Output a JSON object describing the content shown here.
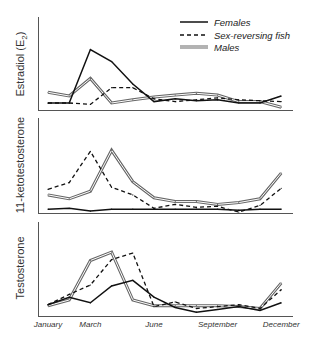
{
  "chart_data": [
    {
      "type": "line",
      "panel": "estradiol",
      "ylabel": "Estradiol (E",
      "ylabel_sub": "2",
      "ylabel_close": ")",
      "ylim": [
        0,
        100
      ],
      "x": [
        "Jan",
        "Feb",
        "Mar",
        "Apr",
        "May",
        "Jun",
        "Jul",
        "Aug",
        "Sep",
        "Oct",
        "Nov",
        "Dec"
      ],
      "series": [
        {
          "name": "Females",
          "style": "solid",
          "values": [
            7.5,
            7.5,
            65,
            52,
            28,
            9,
            12,
            10,
            11,
            7.5,
            7.5,
            15
          ]
        },
        {
          "name": "Sex-reversing fish",
          "style": "dashed",
          "values": [
            7.5,
            7.5,
            6,
            24,
            24,
            12,
            9,
            11,
            13,
            11,
            10,
            9
          ]
        },
        {
          "name": "Males",
          "style": "double",
          "values": [
            19,
            15,
            34,
            7.5,
            11,
            14,
            16,
            18,
            16,
            9,
            9,
            3
          ]
        }
      ]
    },
    {
      "type": "line",
      "panel": "ketotestosterone",
      "ylabel": "11-ketotestosterone",
      "ylim": [
        0,
        100
      ],
      "x": [
        "Jan",
        "Feb",
        "Mar",
        "Apr",
        "May",
        "Jun",
        "Jul",
        "Aug",
        "Sep",
        "Oct",
        "Nov",
        "Dec"
      ],
      "series": [
        {
          "name": "Females",
          "style": "solid",
          "values": [
            4,
            5,
            2,
            4,
            4,
            4,
            4,
            4,
            4,
            3,
            4,
            4
          ]
        },
        {
          "name": "Sex-reversing fish",
          "style": "dashed",
          "values": [
            25,
            32,
            65,
            27,
            19,
            5,
            9,
            6,
            7,
            1,
            8,
            26
          ]
        },
        {
          "name": "Males",
          "style": "double",
          "values": [
            19,
            15,
            23,
            66,
            33,
            16,
            12,
            12,
            9,
            11,
            15,
            42
          ]
        }
      ]
    },
    {
      "type": "line",
      "panel": "testosterone",
      "ylabel": "Testosterone",
      "ylim": [
        0,
        100
      ],
      "x": [
        "Jan",
        "Feb",
        "Mar",
        "Apr",
        "May",
        "Jun",
        "Jul",
        "Aug",
        "Sep",
        "Oct",
        "Nov",
        "Dec"
      ],
      "xtick_labels": [
        {
          "label": "January",
          "month_index": 0
        },
        {
          "label": "March",
          "month_index": 2
        },
        {
          "label": "June",
          "month_index": 5
        },
        {
          "label": "September",
          "month_index": 8
        },
        {
          "label": "December",
          "month_index": 11
        }
      ],
      "series": [
        {
          "name": "Females",
          "style": "solid",
          "values": [
            12,
            20,
            14,
            32,
            38,
            20,
            9,
            4,
            7,
            10,
            6,
            14
          ]
        },
        {
          "name": "Sex-reversing fish",
          "style": "dashed",
          "values": [
            12,
            23,
            33,
            60,
            67,
            10,
            15,
            8,
            10,
            12,
            8,
            28
          ]
        },
        {
          "name": "Males",
          "style": "double",
          "values": [
            11,
            17,
            59,
            68,
            17,
            11,
            11,
            11,
            11,
            10,
            8,
            35
          ]
        }
      ]
    }
  ],
  "legend": {
    "placement": "top-right",
    "entries": [
      {
        "label": "Females",
        "style": "solid"
      },
      {
        "label": "Sex-reversing fish",
        "style": "dashed"
      },
      {
        "label": "Males",
        "style": "double"
      }
    ]
  }
}
